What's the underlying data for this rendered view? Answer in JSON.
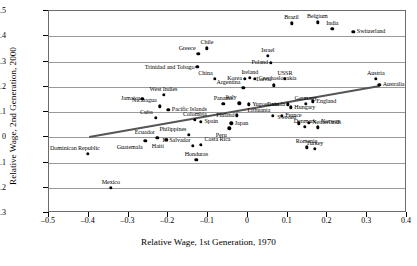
{
  "chart_data": {
    "type": "scatter",
    "title": "",
    "xlabel": "Relative Wage, 1st Generation, 1970",
    "ylabel": "Relative Wage, 2nd Generation, 2000",
    "xlim": [
      -0.5,
      0.4
    ],
    "ylim": [
      -0.3,
      0.5
    ],
    "xticks": [
      -0.5,
      -0.4,
      -0.3,
      -0.2,
      -0.1,
      0,
      0.1,
      0.2,
      0.3,
      0.4
    ],
    "xticklabels": [
      "-0.5",
      "-0.4",
      "-0.3",
      "-0.2",
      "-0.1",
      "0",
      "0.1",
      "0.2",
      "0.3",
      "0.4"
    ],
    "yticks": [
      -0.3,
      -0.2,
      -0.1,
      0,
      0.1,
      0.2,
      0.3,
      0.4,
      0.5
    ],
    "yticklabels": [
      "-0.3",
      "-0.2",
      "-0.1",
      "0",
      "0.1",
      "0.2",
      "0.3",
      "0.4",
      "0.5"
    ],
    "grid": "horizontal",
    "legend": "none",
    "trendline": {
      "x0": -0.4,
      "y0": 0.003,
      "x1": 0.33,
      "y1": 0.205
    },
    "points": [
      {
        "label": "Dominican Republic",
        "x": -0.402,
        "y": -0.065,
        "lx": "left",
        "ly": "above"
      },
      {
        "label": "Mexico",
        "x": -0.345,
        "y": -0.2,
        "lx": "center",
        "ly": "above"
      },
      {
        "label": "Jamaica",
        "x": -0.265,
        "y": 0.153,
        "lx": "left",
        "ly": "mid"
      },
      {
        "label": "Guatemala",
        "x": -0.258,
        "y": -0.013,
        "lx": "left",
        "ly": "below"
      },
      {
        "label": "Cuba",
        "x": -0.232,
        "y": 0.077,
        "lx": "left",
        "ly": "above"
      },
      {
        "label": "Ecuador",
        "x": -0.228,
        "y": -0.003,
        "lx": "left",
        "ly": "above"
      },
      {
        "label": "Nicaragua",
        "x": -0.222,
        "y": 0.122,
        "lx": "left",
        "ly": "above"
      },
      {
        "label": "West Indies",
        "x": -0.212,
        "y": 0.168,
        "lx": "center",
        "ly": "above"
      },
      {
        "label": "Haiti",
        "x": -0.205,
        "y": -0.01,
        "lx": "left",
        "ly": "below"
      },
      {
        "label": "Pacific Islands",
        "x": -0.2,
        "y": 0.108,
        "lx": "right",
        "ly": "mid"
      },
      {
        "label": "Philippines",
        "x": -0.148,
        "y": 0.01,
        "lx": "left",
        "ly": "above"
      },
      {
        "label": "El Salvador",
        "x": -0.138,
        "y": -0.033,
        "lx": "left",
        "ly": "above"
      },
      {
        "label": "Colombia",
        "x": -0.133,
        "y": 0.07,
        "lx": "center",
        "ly": "above"
      },
      {
        "label": "Honduras",
        "x": -0.13,
        "y": -0.09,
        "lx": "center",
        "ly": "above"
      },
      {
        "label": "Trinidad and Tobago",
        "x": -0.127,
        "y": 0.278,
        "lx": "left",
        "ly": "mid"
      },
      {
        "label": "Greece",
        "x": -0.125,
        "y": 0.33,
        "lx": "left",
        "ly": "above"
      },
      {
        "label": "Costa Rica",
        "x": -0.118,
        "y": -0.03,
        "lx": "right",
        "ly": "above"
      },
      {
        "label": "Spain",
        "x": -0.118,
        "y": 0.062,
        "lx": "right",
        "ly": "mid"
      },
      {
        "label": "Chile",
        "x": -0.103,
        "y": 0.352,
        "lx": "center",
        "ly": "above"
      },
      {
        "label": "China",
        "x": -0.083,
        "y": 0.232,
        "lx": "left",
        "ly": "above"
      },
      {
        "label": "Panama",
        "x": -0.062,
        "y": 0.133,
        "lx": "center",
        "ly": "above"
      },
      {
        "label": "Peru",
        "x": -0.047,
        "y": 0.036,
        "lx": "left",
        "ly": "below"
      },
      {
        "label": "Japan",
        "x": -0.042,
        "y": 0.055,
        "lx": "right",
        "ly": "mid"
      },
      {
        "label": "Finland",
        "x": -0.028,
        "y": 0.087,
        "lx": "left",
        "ly": "mid"
      },
      {
        "label": "Italy",
        "x": -0.022,
        "y": 0.135,
        "lx": "left",
        "ly": "above"
      },
      {
        "label": "Argentina",
        "x": -0.012,
        "y": 0.196,
        "lx": "left",
        "ly": "above"
      },
      {
        "label": "Korea",
        "x": -0.008,
        "y": 0.232,
        "lx": "left",
        "ly": "mid"
      },
      {
        "label": "Yugoslavia",
        "x": 0.002,
        "y": 0.13,
        "lx": "right",
        "ly": "mid"
      },
      {
        "label": "Ireland",
        "x": 0.005,
        "y": 0.236,
        "lx": "center",
        "ly": "above"
      },
      {
        "label": "Czechoslovakia",
        "x": 0.018,
        "y": 0.232,
        "lx": "right",
        "ly": "mid"
      },
      {
        "label": "Brazil",
        "x": 0.11,
        "y": 0.452,
        "lx": "center",
        "ly": "above"
      },
      {
        "label": "Israel",
        "x": 0.05,
        "y": 0.322,
        "lx": "center",
        "ly": "above"
      },
      {
        "label": "Poland",
        "x": 0.058,
        "y": 0.295,
        "lx": "left",
        "ly": "mid"
      },
      {
        "label": "Lithuania",
        "x": 0.063,
        "y": 0.085,
        "lx": "left",
        "ly": "above"
      },
      {
        "label": "Latvia",
        "x": 0.065,
        "y": 0.205,
        "lx": "left",
        "ly": "above"
      },
      {
        "label": "USSR",
        "x": 0.093,
        "y": 0.232,
        "lx": "center",
        "ly": "above"
      },
      {
        "label": "France",
        "x": 0.085,
        "y": 0.085,
        "lx": "right",
        "ly": "mid"
      },
      {
        "label": "Canada",
        "x": 0.1,
        "y": 0.13,
        "lx": "left",
        "ly": "mid"
      },
      {
        "label": "Hungary",
        "x": 0.108,
        "y": 0.118,
        "lx": "right",
        "ly": "mid"
      },
      {
        "label": "Sweden",
        "x": 0.128,
        "y": 0.055,
        "lx": "left",
        "ly": "above"
      },
      {
        "label": "Germany",
        "x": 0.145,
        "y": 0.133,
        "lx": "center",
        "ly": "above"
      },
      {
        "label": "Denmark",
        "x": 0.143,
        "y": 0.042,
        "lx": "center",
        "ly": "above"
      },
      {
        "label": "Romania",
        "x": 0.148,
        "y": -0.04,
        "lx": "center",
        "ly": "above"
      },
      {
        "label": "Netherlands",
        "x": 0.153,
        "y": 0.058,
        "lx": "right",
        "ly": "mid"
      },
      {
        "label": "England",
        "x": 0.163,
        "y": 0.143,
        "lx": "right",
        "ly": "mid"
      },
      {
        "label": "Turkey",
        "x": 0.168,
        "y": -0.045,
        "lx": "center",
        "ly": "above"
      },
      {
        "label": "Norway",
        "x": 0.175,
        "y": 0.04,
        "lx": "right",
        "ly": "above"
      },
      {
        "label": "India",
        "x": 0.212,
        "y": 0.43,
        "lx": "center",
        "ly": "above"
      },
      {
        "label": "Belgium",
        "x": 0.175,
        "y": 0.455,
        "lx": "center",
        "ly": "above"
      },
      {
        "label": "Switzerland",
        "x": 0.265,
        "y": 0.418,
        "lx": "right",
        "ly": "mid"
      },
      {
        "label": "Austria",
        "x": 0.322,
        "y": 0.232,
        "lx": "center",
        "ly": "above"
      },
      {
        "label": "Australia",
        "x": 0.33,
        "y": 0.208,
        "lx": "right",
        "ly": "mid"
      }
    ]
  }
}
